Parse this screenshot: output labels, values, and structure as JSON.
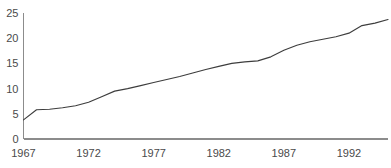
{
  "chart_data": {
    "type": "line",
    "title": "",
    "subtitle": "",
    "xlabel": "",
    "ylabel": "",
    "grid": false,
    "legend": false,
    "legend_position": "none",
    "line_color": "#3d3d3d",
    "axis_color": "#8c8c8c",
    "tick_label_color": "#4a4a4a",
    "background_color": "#ffffff",
    "xlim": [
      1967,
      1995
    ],
    "ylim": [
      0,
      25
    ],
    "yticks": [
      0,
      5,
      10,
      15,
      20,
      25
    ],
    "ytick_labels": [
      "0",
      "5",
      "10",
      "15",
      "20",
      "25"
    ],
    "xticks": [
      1967,
      1972,
      1977,
      1982,
      1987,
      1992
    ],
    "xtick_labels": [
      "1967",
      "1972",
      "1977",
      "1982",
      "1987",
      "1992"
    ],
    "x": [
      1967,
      1968,
      1969,
      1970,
      1971,
      1972,
      1973,
      1974,
      1975,
      1976,
      1977,
      1978,
      1979,
      1980,
      1981,
      1982,
      1983,
      1984,
      1985,
      1986,
      1987,
      1988,
      1989,
      1990,
      1991,
      1992,
      1993,
      1994,
      1995
    ],
    "values": [
      3.8,
      5.8,
      5.9,
      6.2,
      6.6,
      7.3,
      8.4,
      9.5,
      10.0,
      10.6,
      11.2,
      11.8,
      12.4,
      13.1,
      13.8,
      14.4,
      15.0,
      15.3,
      15.5,
      16.3,
      17.6,
      18.6,
      19.3,
      19.8,
      20.3,
      21.0,
      22.5,
      23.0,
      23.7
    ],
    "series": [
      {
        "name": "",
        "values": [
          3.8,
          5.8,
          5.9,
          6.2,
          6.6,
          7.3,
          8.4,
          9.5,
          10.0,
          10.6,
          11.2,
          11.8,
          12.4,
          13.1,
          13.8,
          14.4,
          15.0,
          15.3,
          15.5,
          16.3,
          17.6,
          18.6,
          19.3,
          19.8,
          20.3,
          21.0,
          22.5,
          23.0,
          23.7
        ]
      }
    ]
  },
  "layout": {
    "plot_left": 23.5,
    "plot_right": 388,
    "plot_top": 13,
    "plot_bottom": 139,
    "x_axis_label_y": 157
  }
}
